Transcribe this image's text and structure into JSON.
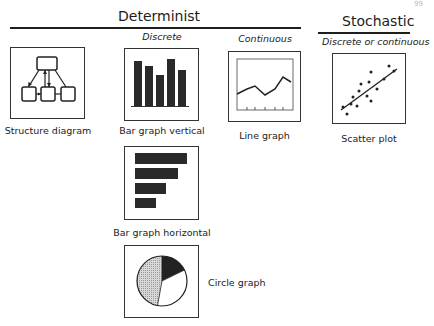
{
  "page_number": "99",
  "groups": {
    "determinist": {
      "title": "Determinist"
    },
    "stochastic": {
      "title": "Stochastic"
    }
  },
  "subheadings": {
    "discrete": "Discrete",
    "continuous": "Continuous",
    "discrete_or_continuous": "Discrete or continuous"
  },
  "items": {
    "structure_diagram": {
      "label": "Structure diagram",
      "icon": "structure-diagram-icon"
    },
    "bar_vertical": {
      "label": "Bar graph vertical",
      "icon": "bar-graph-vertical-icon"
    },
    "line_graph": {
      "label": "Line graph",
      "icon": "line-graph-icon"
    },
    "scatter_plot": {
      "label": "Scatter plot",
      "icon": "scatter-plot-icon"
    },
    "bar_horizontal": {
      "label": "Bar graph horizontal",
      "icon": "bar-graph-horizontal-icon"
    },
    "circle_graph": {
      "label": "Circle graph",
      "icon": "circle-graph-icon"
    }
  },
  "colors": {
    "ink": "#1e1e1e",
    "bar_fill": "#2a2a2a",
    "pie_dark": "#222222",
    "pie_dotted": "#c8c8c8",
    "pie_white": "#ffffff"
  }
}
